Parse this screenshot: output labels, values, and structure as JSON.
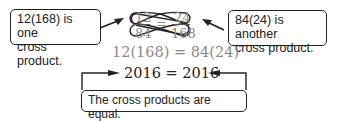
{
  "left_callout": {
    "line1": "12(168) is one",
    "line2": "cross product."
  },
  "right_callout": {
    "line1": "84(24) is another",
    "line2": "cross product."
  },
  "proportion": {
    "top_left": "12",
    "top_right": "24",
    "bottom_left": "84",
    "bottom_right": "168",
    "equals": "="
  },
  "equation": {
    "left": "12(168)",
    "equals": " = ",
    "right": "84(24)"
  },
  "result": {
    "text": "2016 = 2016"
  },
  "bottom_callout": {
    "text": "The cross products are equal."
  }
}
